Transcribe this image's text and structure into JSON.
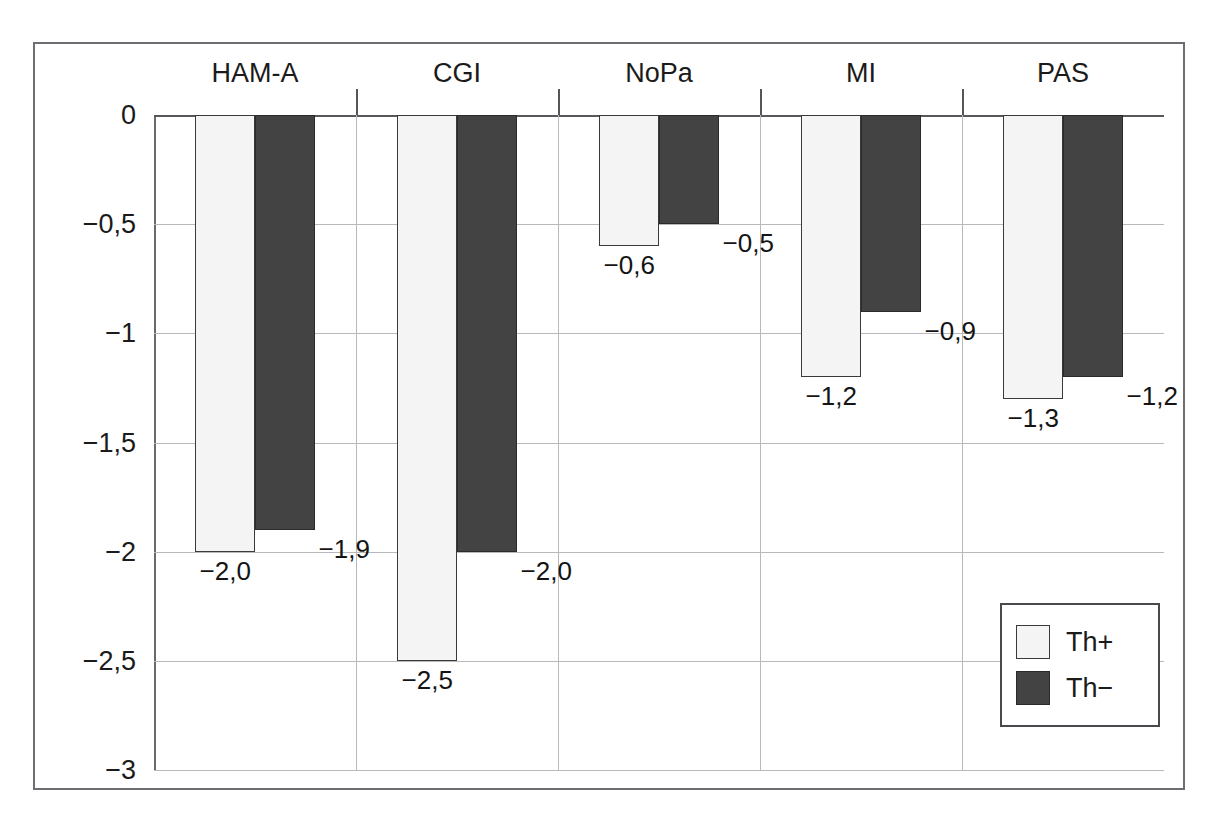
{
  "chart_data": {
    "type": "bar",
    "title": "",
    "subtitle": "",
    "xlabel": "",
    "ylabel": "",
    "categories": [
      "HAM-A",
      "CGI",
      "NoPa",
      "MI",
      "PAS"
    ],
    "series": [
      {
        "name": "Th+",
        "values": [
          -2.0,
          -2.5,
          -0.6,
          -1.2,
          -1.3
        ],
        "labels": [
          "−2,0",
          "−2,5",
          "−0,6",
          "−1,2",
          "−1,3"
        ],
        "color": "#f4f4f4"
      },
      {
        "name": "Th−",
        "values": [
          -1.9,
          -2.0,
          -0.5,
          -0.9,
          -1.2
        ],
        "labels": [
          "−1,9",
          "−2,0",
          "−0,5",
          "−0,9",
          "−1,2"
        ],
        "color": "#434343"
      }
    ],
    "ylim": [
      -3,
      0
    ],
    "yticks": [
      0,
      -0.5,
      -1,
      -1.5,
      -2,
      -2.5,
      -3
    ],
    "ytick_labels": [
      "0",
      "−0,5",
      "−1",
      "−1,5",
      "−2",
      "−2,5",
      "−3"
    ],
    "grid": true,
    "legend_position": "bottom-right",
    "decimal_separator": ","
  },
  "legend": {
    "entries": [
      {
        "label": "Th+"
      },
      {
        "label": "Th−"
      }
    ]
  }
}
